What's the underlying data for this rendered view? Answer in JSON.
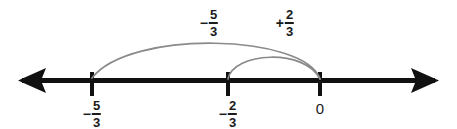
{
  "figure": {
    "type": "number-line-diagram",
    "width": 457,
    "height": 128,
    "background_color": "#ffffff",
    "axis_color": "#111111",
    "arc_color": "#8a8a8a",
    "text_color": "#1a1a1a"
  },
  "axis": {
    "name": "number-line",
    "y": 80,
    "x_start": 18,
    "x_end": 439,
    "left_arrowhead": true,
    "right_arrowhead": true,
    "thickness": 5
  },
  "ticks": [
    {
      "id": "tick-neg-5-3",
      "x": 92,
      "value": "-5/3",
      "label": {
        "sign": "−",
        "numerator": "5",
        "denominator": "3"
      }
    },
    {
      "id": "tick-neg-2-3",
      "x": 228,
      "value": "-2/3",
      "label": {
        "sign": "−",
        "numerator": "2",
        "denominator": "3"
      }
    },
    {
      "id": "tick-zero",
      "x": 320,
      "value": "0",
      "label": {
        "text": "0"
      }
    }
  ],
  "arcs": [
    {
      "id": "arc-minus-five-thirds",
      "from_x": 92,
      "to_x": 320,
      "apex_y": 38,
      "direction": "leftward",
      "label": {
        "sign": "−",
        "numerator": "5",
        "denominator": "3"
      },
      "label_text": "-5/3",
      "label_x": 209,
      "label_y": 8
    },
    {
      "id": "arc-plus-two-thirds",
      "from_x": 228,
      "to_x": 320,
      "apex_y": 54,
      "direction": "rightward",
      "label": {
        "sign": "+",
        "numerator": "2",
        "denominator": "3"
      },
      "label_text": "+2/3",
      "label_x": 285,
      "label_y": 8
    }
  ]
}
